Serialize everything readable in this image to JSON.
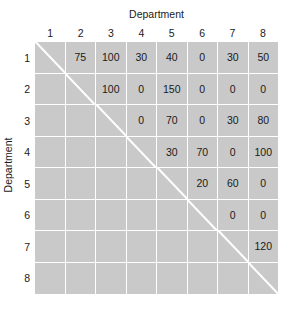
{
  "axes": {
    "column_title": "Department",
    "row_title": "Department",
    "column_labels": [
      "1",
      "2",
      "3",
      "4",
      "5",
      "6",
      "7",
      "8"
    ],
    "row_labels": [
      "1",
      "2",
      "3",
      "4",
      "5",
      "6",
      "7",
      "8"
    ]
  },
  "colors": {
    "cell_fill": "#c9c9c9",
    "gridline": "#ffffff",
    "diagonal_line": "#ffffff",
    "text": "#1a1a1a",
    "background": "#ffffff"
  },
  "chart_data": {
    "type": "heatmap",
    "title": "",
    "xlabel": "Department",
    "ylabel": "Department",
    "categories": [
      "1",
      "2",
      "3",
      "4",
      "5",
      "6",
      "7",
      "8"
    ],
    "rows": [
      "1",
      "2",
      "3",
      "4",
      "5",
      "6",
      "7",
      "8"
    ],
    "matrix_form": "upper-triangular",
    "grid": true,
    "legend": "none",
    "diagonal_marked": true,
    "values": [
      [
        null,
        "75",
        "100",
        "30",
        "40",
        "0",
        "30",
        "50"
      ],
      [
        null,
        null,
        "100",
        "0",
        "150",
        "0",
        "0",
        "0"
      ],
      [
        null,
        null,
        null,
        "0",
        "70",
        "0",
        "30",
        "80"
      ],
      [
        null,
        null,
        null,
        null,
        "30",
        "70",
        "0",
        "100"
      ],
      [
        null,
        null,
        null,
        null,
        null,
        "20",
        "60",
        "0"
      ],
      [
        null,
        null,
        null,
        null,
        null,
        null,
        "0",
        "0"
      ],
      [
        null,
        null,
        null,
        null,
        null,
        null,
        null,
        "120"
      ],
      [
        null,
        null,
        null,
        null,
        null,
        null,
        null,
        null
      ]
    ]
  }
}
